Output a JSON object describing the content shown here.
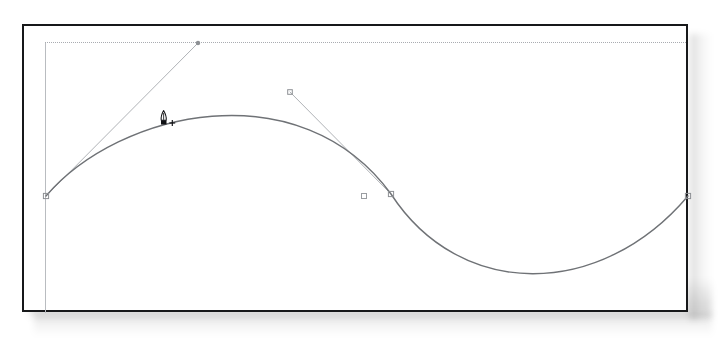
{
  "app": {
    "tool": "pen-tool",
    "tool_label": "Pen Tool",
    "cursor_mode": "add-anchor-point",
    "canvas_title": "Bezier Curve Path Editing Canvas"
  },
  "canvas": {
    "width": 722,
    "height": 341,
    "background_color": "#ffffff",
    "frame": {
      "name": "document-frame",
      "x": 22,
      "y": 24,
      "width": 666,
      "height": 288,
      "border_color": "#17181a",
      "border_width": 2,
      "fill_color": "#ffffff",
      "has_drop_shadow": true
    },
    "artboard_guides": {
      "name": "artboard-guides",
      "color": "#b9bcc0",
      "left_edge": {
        "x": 45,
        "y1": 42,
        "y2": 313
      },
      "top_edge": {
        "y": 42,
        "x1": 45,
        "x2": 686,
        "style": "dotted"
      }
    }
  },
  "path": {
    "name": "bezier-path",
    "stroke_color": "#6f7276",
    "stroke_width": 1.4,
    "fill": "none",
    "description": "S-shaped cubic bezier wave, one hump up then one trough down",
    "anchors": [
      {
        "name": "anchor-start",
        "x": 46,
        "y": 196,
        "selected": true,
        "style": "hollow-square"
      },
      {
        "name": "anchor-middle",
        "x": 391,
        "y": 194,
        "selected": false,
        "style": "hollow-square"
      },
      {
        "name": "anchor-end",
        "x": 688,
        "y": 196,
        "selected": false,
        "style": "hollow-square"
      }
    ],
    "segments": [
      {
        "from": [
          46,
          196
        ],
        "c1": [
          120,
          110
        ],
        "c2": [
          300,
          70
        ],
        "to": [
          391,
          194
        ]
      },
      {
        "from": [
          391,
          194
        ],
        "c1": [
          460,
          300
        ],
        "c2": [
          600,
          300
        ],
        "to": [
          688,
          196
        ]
      }
    ],
    "peak": {
      "x": 225,
      "y": 96
    },
    "trough": {
      "x": 527,
      "y": 288
    }
  },
  "handles": {
    "name": "direction-handles",
    "line_color": "#b0b3b7",
    "line_width": 1,
    "items": [
      {
        "name": "handle-left-tangent",
        "from": [
          46,
          196
        ],
        "to": [
          198,
          43
        ],
        "endpoint_style": "dot",
        "endpoint_color": "#8d9094"
      },
      {
        "name": "handle-right-tangent",
        "from": [
          391,
          194
        ],
        "to": [
          290,
          92
        ],
        "endpoint_style": "hollow-square",
        "endpoint_color": "#8d9094"
      }
    ],
    "free_point": {
      "name": "control-point-marker",
      "x": 364,
      "y": 196,
      "style": "hollow-square",
      "color": "#9a9da1"
    }
  },
  "cursor": {
    "name": "pen-tool-cursor",
    "x": 163,
    "y": 120,
    "glyph": "pen-nib-plus",
    "badge": "+",
    "color": "#101114"
  }
}
